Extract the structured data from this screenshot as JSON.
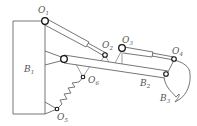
{
  "diagram": {
    "type": "mechanism-schematic",
    "title": "",
    "bodies": [
      {
        "id": "B1",
        "label": "B",
        "sub": "1",
        "role": "frame / base"
      },
      {
        "id": "B2",
        "label": "B",
        "sub": "2",
        "role": "boom arm"
      },
      {
        "id": "B3",
        "label": "B",
        "sub": "3",
        "role": "bucket"
      }
    ],
    "joints": [
      {
        "id": "O1",
        "label": "O",
        "sub": "1"
      },
      {
        "id": "O2",
        "label": "O",
        "sub": "2"
      },
      {
        "id": "O3",
        "label": "O",
        "sub": "3"
      },
      {
        "id": "O4",
        "label": "O",
        "sub": "4"
      },
      {
        "id": "O5",
        "label": "O",
        "sub": "5"
      },
      {
        "id": "O6",
        "label": "O",
        "sub": "6"
      }
    ],
    "components": [
      {
        "id": "cylinder-1",
        "from": "O1",
        "to": "O2",
        "kind": "hydraulic cylinder"
      },
      {
        "id": "cylinder-2",
        "from": "O3",
        "to": "O4",
        "kind": "hydraulic cylinder"
      },
      {
        "id": "spring",
        "from": "O5",
        "to": "O6",
        "kind": "spring"
      }
    ]
  }
}
